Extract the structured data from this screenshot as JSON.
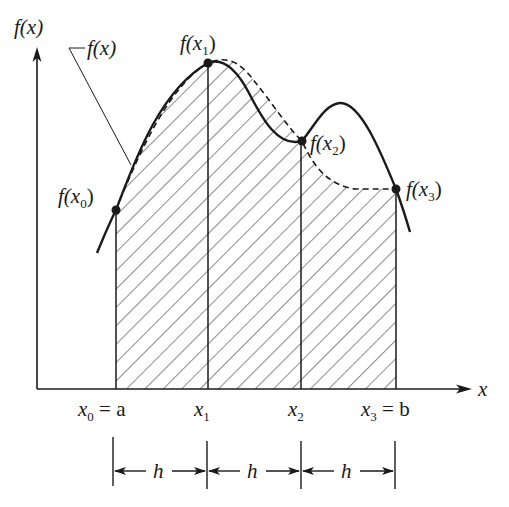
{
  "figure": {
    "axes": {
      "y_label": "f(x)",
      "x_label": "x"
    },
    "curve_label": "f(x)",
    "points": [
      {
        "label": "f(x",
        "sub": "0",
        "close": ")"
      },
      {
        "label": "f(x",
        "sub": "1",
        "close": ")"
      },
      {
        "label": "f(x",
        "sub": "2",
        "close": ")"
      },
      {
        "label": "f(x",
        "sub": "3",
        "close": ")"
      }
    ],
    "ticks": [
      {
        "base": "x",
        "sub": "0",
        "suffix": " = a"
      },
      {
        "base": "x",
        "sub": "1",
        "suffix": ""
      },
      {
        "base": "x",
        "sub": "2",
        "suffix": ""
      },
      {
        "base": "x",
        "sub": "3",
        "suffix": " = b"
      }
    ],
    "interval_labels": [
      "h",
      "h",
      "h"
    ],
    "legend": {
      "solid": "true function f(x)",
      "dashed": "interpolating polynomial",
      "hatched": "approximate area"
    },
    "colors": {
      "ink": "#1a1a1a",
      "background": "#ffffff"
    }
  }
}
